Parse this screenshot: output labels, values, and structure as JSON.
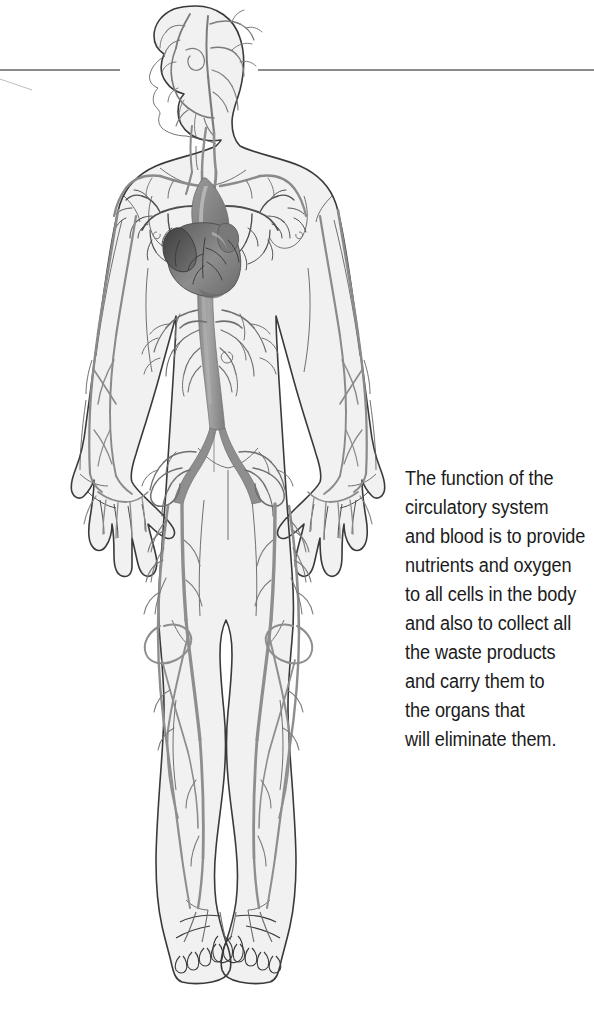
{
  "page": {
    "background_color": "#ffffff",
    "width": 594,
    "height": 1031
  },
  "figure": {
    "colors": {
      "body_fill": "#f1f1f1",
      "body_outline": "#3a3a3a",
      "vessel_major": "#8e8e8e",
      "vessel_minor": "#6f6f6f",
      "heart_dark": "#4a4a4a",
      "heart_mid": "#8a8a8a",
      "heart_light": "#b4b4b4",
      "rule_line": "#8c8c8c",
      "caption_text": "#1b1b1b"
    },
    "parts": [
      "head",
      "neck",
      "torso",
      "left-arm",
      "right-arm",
      "left-hand",
      "right-hand",
      "pelvis",
      "left-leg",
      "right-leg",
      "left-foot",
      "right-foot",
      "heart",
      "aorta",
      "pulmonary-vessels"
    ]
  },
  "rule": {
    "left_segment": {
      "x1": 0,
      "x2": 120,
      "y": 70
    },
    "right_segment": {
      "x1": 258,
      "x2": 594,
      "y": 70
    },
    "hairline": {
      "x1": 0,
      "x2": 30,
      "y1": 79,
      "y2": 89
    }
  },
  "caption": {
    "lines": [
      "The function of the",
      "circulatory system",
      "and blood is to provide",
      "nutrients and oxygen",
      "to all cells in the body",
      "and also to collect all",
      "the waste products",
      "and carry them to",
      "the organs that",
      "will eliminate them."
    ]
  }
}
